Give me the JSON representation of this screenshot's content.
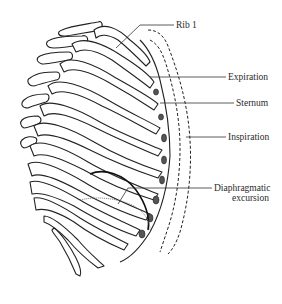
{
  "figure": {
    "labels": {
      "rib1": "Rib 1",
      "expiration": "Expiration",
      "sternum": "Sternum",
      "inspiration": "Inspiration",
      "diaphragmatic_line1": "Diaphragmatic",
      "diaphragmatic_line2": "excursion"
    },
    "outlines": [
      {
        "name": "expiration-outline",
        "style": "solid"
      },
      {
        "name": "inspiration-outline-inner",
        "style": "dashed"
      },
      {
        "name": "inspiration-outline-outer",
        "style": "dashed"
      }
    ],
    "colors": {
      "line": "#222222",
      "background": "#ffffff"
    }
  }
}
